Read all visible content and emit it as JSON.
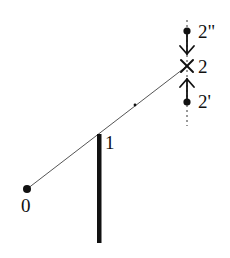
{
  "diagram": {
    "labels": {
      "point0": "0",
      "point1": "1",
      "point2": "2",
      "point2prime": "2'",
      "point2doubleprime": "2\""
    },
    "elements": {
      "source_point": {
        "name": "0",
        "x": 27,
        "y": 189
      },
      "barrier": {
        "name": "1",
        "x": 99,
        "y_top": 134,
        "y_bottom": 243
      },
      "target_cross": {
        "name": "2",
        "x": 187,
        "y": 66
      },
      "upper_point": {
        "name": "2\"",
        "x": 187,
        "y": 31
      },
      "lower_point": {
        "name": "2'",
        "x": 187,
        "y": 102
      },
      "mid_marker": {
        "x": 135,
        "y": 105
      }
    },
    "colors": {
      "line": "#555555",
      "ink": "#111111"
    }
  }
}
